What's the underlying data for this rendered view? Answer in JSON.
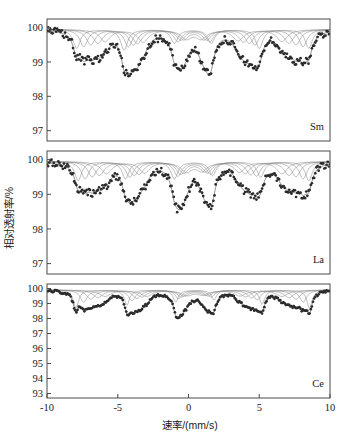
{
  "figure": {
    "xlabel": "速率/(mm/s)",
    "ylabel": "相对透射率/%",
    "xticks": [
      "-10",
      "-5",
      "0",
      "5",
      "10"
    ],
    "xtickvals": [
      -10,
      -5,
      0,
      5,
      10
    ],
    "xlim": [
      -10,
      10
    ],
    "colors": {
      "marker": "#2b2b2b",
      "fit_curve": "#6b6b6b",
      "sub_curve": "#8a8a8a",
      "frame": "#4a4a4a",
      "background": "#ffffff"
    }
  },
  "chart_data": {
    "type": "line",
    "title": "",
    "xlabel": "速率/(mm/s)",
    "ylabel": "相对透射率/%",
    "xlim": [
      -10,
      10
    ],
    "grid": false,
    "legend_position": "inside-bottom-right",
    "panels": [
      {
        "label": "Sm",
        "ylim": [
          96.7,
          100.25
        ],
        "yticks": [
          100,
          99,
          98,
          97
        ],
        "ytick_labels": [
          "100",
          "99",
          "98",
          "97"
        ],
        "baseline": 99.95,
        "sextet_positions": [
          -7.8,
          -4.5,
          -0.9,
          1.7,
          5.1,
          8.6
        ],
        "sextet_depths": [
          2.4,
          2.6,
          1.9,
          1.85,
          2.25,
          2.4
        ],
        "sub_components": [
          {
            "name": "sextet-1",
            "centers": [
              -7.9,
              -4.55,
              -1.0,
              1.6,
              5.0,
              8.5
            ],
            "depths": [
              0.55,
              0.6,
              0.4,
              0.4,
              0.55,
              0.55
            ],
            "width": 0.3
          },
          {
            "name": "sextet-2",
            "centers": [
              -7.4,
              -4.25,
              -0.75,
              1.5,
              4.7,
              8.1
            ],
            "depths": [
              0.5,
              0.5,
              0.35,
              0.35,
              0.45,
              0.5
            ],
            "width": 0.34
          },
          {
            "name": "sextet-3",
            "centers": [
              -6.9,
              -3.9,
              -0.55,
              1.3,
              4.3,
              7.6
            ],
            "depths": [
              0.45,
              0.45,
              0.3,
              0.3,
              0.4,
              0.45
            ],
            "width": 0.38
          },
          {
            "name": "sextet-4",
            "centers": [
              -6.4,
              -3.6,
              -0.35,
              1.1,
              3.9,
              7.1
            ],
            "depths": [
              0.4,
              0.4,
              0.28,
              0.28,
              0.36,
              0.4
            ],
            "width": 0.42
          },
          {
            "name": "sextet-5",
            "centers": [
              -5.9,
              -3.2,
              -0.15,
              0.9,
              3.5,
              6.6
            ],
            "depths": [
              0.35,
              0.36,
              0.25,
              0.25,
              0.32,
              0.35
            ],
            "width": 0.46
          }
        ],
        "noise_amplitude": 0.11,
        "n_points": 250
      },
      {
        "label": "La",
        "ylim": [
          96.7,
          100.25
        ],
        "yticks": [
          100,
          99,
          98,
          97
        ],
        "ytick_labels": [
          "100",
          "99",
          "98",
          "97"
        ],
        "baseline": 99.95,
        "sextet_positions": [
          -7.7,
          -4.4,
          -0.9,
          1.8,
          5.2,
          8.6
        ],
        "sextet_depths": [
          2.3,
          2.0,
          2.1,
          1.8,
          1.95,
          2.2
        ],
        "sub_components": [
          {
            "name": "sextet-1",
            "centers": [
              -7.8,
              -4.45,
              -1.0,
              1.7,
              5.1,
              8.5
            ],
            "depths": [
              0.55,
              0.5,
              0.5,
              0.4,
              0.45,
              0.55
            ],
            "width": 0.3
          },
          {
            "name": "sextet-2",
            "centers": [
              -7.3,
              -4.15,
              -0.75,
              1.55,
              4.8,
              8.1
            ],
            "depths": [
              0.5,
              0.45,
              0.42,
              0.36,
              0.42,
              0.5
            ],
            "width": 0.34
          },
          {
            "name": "sextet-3",
            "centers": [
              -6.8,
              -3.85,
              -0.55,
              1.35,
              4.4,
              7.6
            ],
            "depths": [
              0.44,
              0.4,
              0.36,
              0.32,
              0.38,
              0.44
            ],
            "width": 0.38
          },
          {
            "name": "sextet-4",
            "centers": [
              -6.3,
              -3.5,
              -0.35,
              1.15,
              4.0,
              7.1
            ],
            "depths": [
              0.4,
              0.36,
              0.32,
              0.28,
              0.34,
              0.4
            ],
            "width": 0.42
          },
          {
            "name": "sextet-5",
            "centers": [
              -5.8,
              -3.1,
              -0.15,
              0.95,
              3.6,
              6.6
            ],
            "depths": [
              0.35,
              0.32,
              0.28,
              0.25,
              0.3,
              0.35
            ],
            "width": 0.46
          }
        ],
        "noise_amplitude": 0.11,
        "n_points": 250
      },
      {
        "label": "Ce",
        "ylim": [
          92.7,
          100.3
        ],
        "yticks": [
          100,
          99,
          98,
          97,
          96,
          95,
          94,
          93
        ],
        "ytick_labels": [
          "100",
          "99",
          "98",
          "97",
          "96",
          "95",
          "94",
          "93"
        ],
        "baseline": 99.9,
        "sextet_positions": [
          -7.9,
          -4.3,
          -0.85,
          1.85,
          5.25,
          8.6
        ],
        "sextet_depths": [
          7.0,
          6.0,
          4.4,
          3.5,
          5.3,
          7.0
        ],
        "sub_components": [
          {
            "name": "sextet-1",
            "centers": [
              -7.95,
              -4.35,
              -0.9,
              1.8,
              5.2,
              8.55
            ],
            "depths": [
              1.2,
              1.0,
              0.8,
              0.65,
              0.95,
              1.2
            ],
            "width": 0.22
          },
          {
            "name": "sextet-2",
            "centers": [
              -7.4,
              -4.0,
              -0.7,
              1.6,
              4.85,
              8.1
            ],
            "depths": [
              0.8,
              0.7,
              0.55,
              0.45,
              0.65,
              0.8
            ],
            "width": 0.3
          },
          {
            "name": "sextet-3",
            "centers": [
              -6.9,
              -3.65,
              -0.5,
              1.4,
              4.45,
              7.6
            ],
            "depths": [
              0.6,
              0.55,
              0.45,
              0.38,
              0.52,
              0.6
            ],
            "width": 0.36
          },
          {
            "name": "sextet-4",
            "centers": [
              -6.4,
              -3.3,
              -0.3,
              1.2,
              4.05,
              7.1
            ],
            "depths": [
              0.5,
              0.45,
              0.38,
              0.32,
              0.44,
              0.5
            ],
            "width": 0.42
          },
          {
            "name": "sextet-5",
            "centers": [
              -5.9,
              -2.95,
              -0.1,
              1.0,
              3.65,
              6.6
            ],
            "depths": [
              0.42,
              0.4,
              0.33,
              0.28,
              0.38,
              0.42
            ],
            "width": 0.48
          }
        ],
        "noise_amplitude": 0.1,
        "n_points": 250
      }
    ]
  }
}
